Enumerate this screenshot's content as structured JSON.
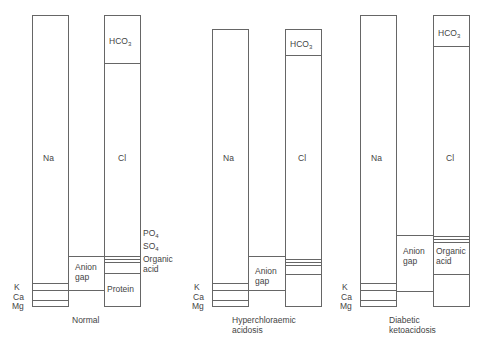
{
  "diagram": {
    "panels": [
      {
        "caption": [
          "Normal"
        ],
        "cation_column": {
          "main": "Na",
          "minor": [
            "K",
            "Ca",
            "Mg"
          ]
        },
        "anion_column": {
          "segments": [
            "HCO3",
            "Cl",
            "PO4",
            "SO4",
            "Organic acid",
            "Protein"
          ]
        },
        "gap_label": [
          "Anion",
          "gap"
        ]
      },
      {
        "caption": [
          "Hyperchloraemic",
          "acidosis"
        ],
        "cation_column": {
          "main": "Na",
          "minor": [
            "K",
            "Ca",
            "Mg"
          ]
        },
        "anion_column": {
          "segments": [
            "HCO3",
            "Cl"
          ]
        },
        "gap_label": [
          "Anion",
          "gap"
        ]
      },
      {
        "caption": [
          "Diabetic",
          "ketoacidosis"
        ],
        "cation_column": {
          "main": "Na",
          "minor": [
            "K",
            "Ca",
            "Mg"
          ]
        },
        "anion_column": {
          "segments": [
            "HCO3",
            "Cl",
            "Organic acid"
          ]
        },
        "gap_label": [
          "Anion",
          "gap"
        ]
      }
    ]
  },
  "labels": {
    "na": "Na",
    "cl": "Cl",
    "hco": "HCO",
    "sub3": "3",
    "k": "K",
    "ca": "Ca",
    "mg": "Mg",
    "po": "PO",
    "so": "SO",
    "sub4": "4",
    "organic": "Organic",
    "acid": "acid",
    "protein": "Protein",
    "anion": "Anion",
    "gap": "gap",
    "normal": "Normal",
    "hyper1": "Hyperchloraemic",
    "hyper2": "acidosis",
    "dka1": "Diabetic",
    "dka2": "ketoacidosis"
  }
}
